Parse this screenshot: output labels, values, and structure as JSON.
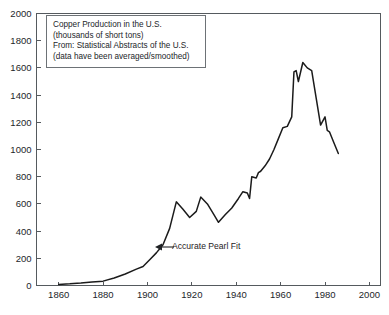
{
  "chart_data": {
    "type": "line",
    "title": "Copper Production in the U.S.",
    "xlabel": "",
    "ylabel": "",
    "xlim": [
      1850,
      2005
    ],
    "ylim": [
      0,
      2000
    ],
    "grid": false,
    "legend_position": "upper-left-inset",
    "xticks": [
      1860,
      1880,
      1900,
      1920,
      1940,
      1960,
      1980,
      2000
    ],
    "yticks": [
      0,
      200,
      400,
      600,
      800,
      1000,
      1200,
      1400,
      1600,
      1800,
      2000
    ],
    "series": [
      {
        "name": "Copper Production (thousands of short tons)",
        "color": "#1b1b1b",
        "x": [
          1860,
          1865,
          1870,
          1875,
          1880,
          1885,
          1890,
          1895,
          1898,
          1901,
          1904,
          1907,
          1910,
          1913,
          1916,
          1919,
          1922,
          1924,
          1927,
          1930,
          1932,
          1935,
          1938,
          1941,
          1943,
          1945,
          1946,
          1947,
          1949,
          1950,
          1951,
          1953,
          1955,
          1957,
          1959,
          1961,
          1963,
          1965,
          1966,
          1967,
          1968,
          1970,
          1972,
          1974,
          1976,
          1978,
          1980,
          1981,
          1982,
          1984,
          1986
        ],
        "y": [
          8,
          12,
          18,
          26,
          32,
          55,
          85,
          120,
          140,
          190,
          240,
          300,
          420,
          615,
          560,
          500,
          545,
          650,
          600,
          520,
          465,
          520,
          570,
          640,
          690,
          680,
          640,
          800,
          790,
          830,
          840,
          880,
          930,
          1000,
          1080,
          1160,
          1170,
          1240,
          1570,
          1580,
          1500,
          1640,
          1600,
          1580,
          1380,
          1180,
          1240,
          1140,
          1130,
          1050,
          970
        ]
      }
    ],
    "annotations": [
      {
        "text": "Accurate Pearl Fit",
        "type": "arrow-left",
        "points_to_x": 1905,
        "points_to_y": 300
      }
    ],
    "legend_text": [
      "Copper Production in the U.S.",
      "(thousands of short tons)",
      "From: Statistical Abstracts of the U.S.",
      "(data have been averaged/smoothed)"
    ]
  },
  "caption": {
    "text": ""
  }
}
